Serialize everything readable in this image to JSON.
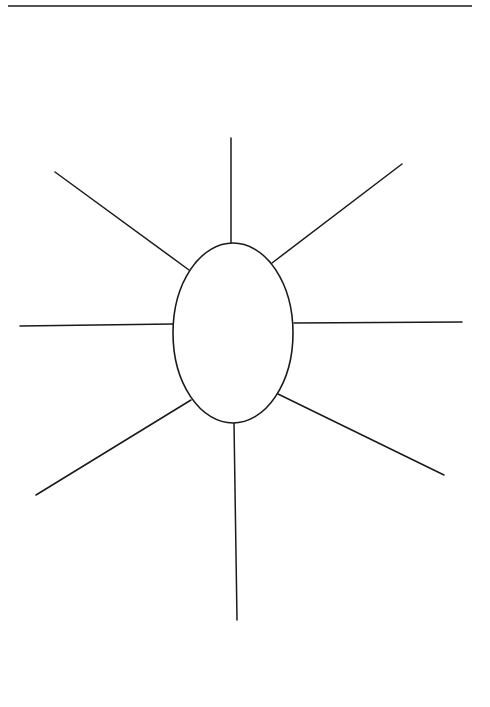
{
  "page": {
    "width": 490,
    "height": 707,
    "background": "#ffffff",
    "stroke_color": "#1a1a1a"
  },
  "diagram": {
    "type": "spider-map",
    "header_rule": {
      "x1": 8,
      "y1": 6,
      "x2": 472,
      "y2": 6,
      "width": 1.4
    },
    "center": {
      "cx": 233,
      "cy": 333,
      "rx": 60,
      "ry": 90,
      "label": ""
    },
    "spokes": [
      {
        "id": "top",
        "x1": 231,
        "y1": 243,
        "x2": 231,
        "y2": 138,
        "label": ""
      },
      {
        "id": "upper-right",
        "x1": 272,
        "y1": 263,
        "x2": 402,
        "y2": 164,
        "label": ""
      },
      {
        "id": "right",
        "x1": 294,
        "y1": 323,
        "x2": 462,
        "y2": 322,
        "label": ""
      },
      {
        "id": "lower-right",
        "x1": 278,
        "y1": 394,
        "x2": 444,
        "y2": 475,
        "label": ""
      },
      {
        "id": "bottom",
        "x1": 234,
        "y1": 423,
        "x2": 237,
        "y2": 620,
        "label": ""
      },
      {
        "id": "lower-left",
        "x1": 191,
        "y1": 400,
        "x2": 36,
        "y2": 495,
        "label": ""
      },
      {
        "id": "left",
        "x1": 173,
        "y1": 324,
        "x2": 20,
        "y2": 326,
        "label": ""
      },
      {
        "id": "upper-left",
        "x1": 189,
        "y1": 270,
        "x2": 55,
        "y2": 172,
        "label": ""
      }
    ]
  }
}
